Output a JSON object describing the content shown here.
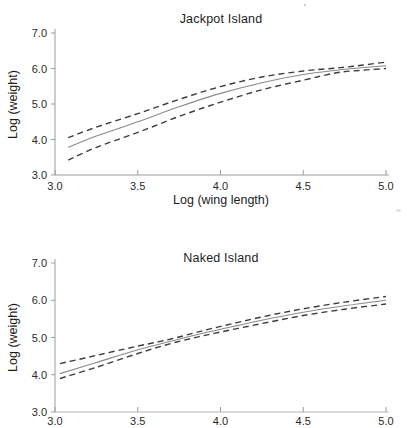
{
  "colors": {
    "axis": "#9b9b9b",
    "axis_secondary": "#b5b5b5",
    "text": "#1c1c1c",
    "fit_line": "#8a8a8a",
    "band_line": "#3c3c3c"
  },
  "chart_data": [
    {
      "type": "line",
      "title": "Jackpot Island",
      "xlabel": "Log (wing length)",
      "ylabel": "Log (weight)",
      "xlim": [
        3.0,
        5.0
      ],
      "ylim": [
        3.0,
        7.0
      ],
      "xticks": [
        "3.0",
        "3.5",
        "4.0",
        "4.5",
        "5.0"
      ],
      "yticks": [
        "3.0",
        "4.0",
        "5.0",
        "6.0",
        "7.0"
      ],
      "grid": false,
      "legend": "none",
      "series": [
        {
          "name": "regression-fit",
          "line_style": "solid",
          "color": "#8a8a8a",
          "x": [
            3.08,
            3.25,
            3.5,
            3.75,
            4.0,
            4.25,
            4.5,
            4.7,
            4.85,
            5.0
          ],
          "y": [
            3.78,
            4.1,
            4.5,
            4.92,
            5.3,
            5.6,
            5.83,
            5.95,
            6.02,
            6.08
          ]
        },
        {
          "name": "upper-confidence-band",
          "line_style": "dashed",
          "color": "#3c3c3c",
          "x": [
            3.08,
            3.25,
            3.5,
            3.75,
            4.0,
            4.25,
            4.5,
            4.7,
            4.85,
            5.0
          ],
          "y": [
            4.05,
            4.35,
            4.73,
            5.13,
            5.49,
            5.76,
            5.93,
            6.01,
            6.09,
            6.18
          ]
        },
        {
          "name": "lower-confidence-band",
          "line_style": "dashed",
          "color": "#3c3c3c",
          "x": [
            3.08,
            3.25,
            3.5,
            3.75,
            4.0,
            4.25,
            4.5,
            4.7,
            4.85,
            5.0
          ],
          "y": [
            3.42,
            3.78,
            4.2,
            4.65,
            5.05,
            5.4,
            5.67,
            5.88,
            5.95,
            6.0
          ]
        }
      ]
    },
    {
      "type": "line",
      "title": "Naked Island",
      "xlabel": "",
      "ylabel": "Log (weight)",
      "xlim": [
        3.0,
        5.0
      ],
      "ylim": [
        3.0,
        7.0
      ],
      "xticks": [
        "3.0",
        "3.5",
        "4.0",
        "4.5",
        "5.0"
      ],
      "yticks": [
        "3.0",
        "4.0",
        "5.0",
        "6.0",
        "7.0"
      ],
      "grid": false,
      "legend": "none",
      "series": [
        {
          "name": "regression-fit",
          "line_style": "solid",
          "color": "#8a8a8a",
          "x": [
            3.03,
            3.25,
            3.5,
            3.7,
            3.9,
            4.1,
            4.3,
            4.5,
            4.75,
            5.0
          ],
          "y": [
            4.03,
            4.33,
            4.67,
            4.9,
            5.12,
            5.32,
            5.51,
            5.68,
            5.85,
            6.0
          ]
        },
        {
          "name": "upper-confidence-band",
          "line_style": "dashed",
          "color": "#3c3c3c",
          "x": [
            3.03,
            3.25,
            3.5,
            3.7,
            3.9,
            4.1,
            4.3,
            4.5,
            4.75,
            5.0
          ],
          "y": [
            4.3,
            4.52,
            4.77,
            4.96,
            5.19,
            5.4,
            5.6,
            5.77,
            5.95,
            6.1
          ]
        },
        {
          "name": "lower-confidence-band",
          "line_style": "dashed",
          "color": "#3c3c3c",
          "x": [
            3.03,
            3.25,
            3.5,
            3.7,
            3.9,
            4.1,
            4.3,
            4.5,
            4.75,
            5.0
          ],
          "y": [
            3.9,
            4.2,
            4.57,
            4.84,
            5.05,
            5.24,
            5.42,
            5.59,
            5.76,
            5.9
          ]
        }
      ]
    }
  ]
}
